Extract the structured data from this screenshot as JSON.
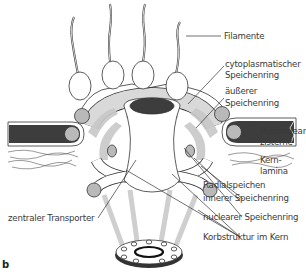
{
  "figure": {
    "panel_letter": "b",
    "colors": {
      "membrane_dark": "#3d3d3d",
      "ring_gray": "#c8c8c8",
      "spoke_gray": "#d2d2d2",
      "bead_gray": "#b9b9b9",
      "outline": "#333333",
      "label_text": "#3a3a3a"
    }
  },
  "labels": {
    "filamente": "Filamente",
    "cytoplasmatischer_1": "cytoplasmatischer",
    "cytoplasmatischer_2": "Speichenring",
    "aeusserer_1": "äußerer",
    "aeusserer_2": "Speichenring",
    "perinuclear_1": "Perinuclear-",
    "perinuclear_2": "zisterne",
    "kernlamina_1": "Kern-",
    "kernlamina_2": "lamina",
    "radialspeichen": "Radialspeichen",
    "innerer": "innerer Speichenring",
    "nuclearer": "nuclearer Speichenring",
    "korbstruktur": "Korbstruktur im Kern",
    "zentraler": "zentraler Transporter"
  }
}
